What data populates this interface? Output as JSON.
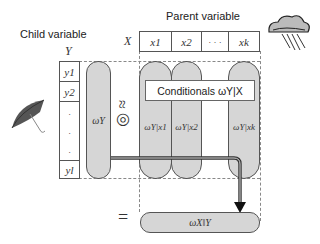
{
  "labels": {
    "child_variable": "Child variable",
    "parent_variable": "Parent variable",
    "child_symbol": "Y",
    "parent_symbol": "X"
  },
  "child_states": [
    "y1",
    "y2",
    ".",
    ".",
    ".",
    "yl"
  ],
  "parent_states": [
    "x1",
    "x2",
    "· · ·",
    "xk"
  ],
  "marginal": "ωY",
  "approx_symbol": "≈◎",
  "conditionals_label": "Conditionals ωY|X",
  "conditionals": [
    "ωY|x1",
    "ωY|x2",
    "ωY|xk"
  ],
  "equals_symbol": "=",
  "result": "ωX‖Y",
  "icons": {
    "child": "umbrella-icon",
    "parent": "rain-cloud-icon"
  },
  "colors": {
    "pill_fill": "#d6d6d6",
    "stroke": "#555555",
    "dashed": "#888888"
  }
}
